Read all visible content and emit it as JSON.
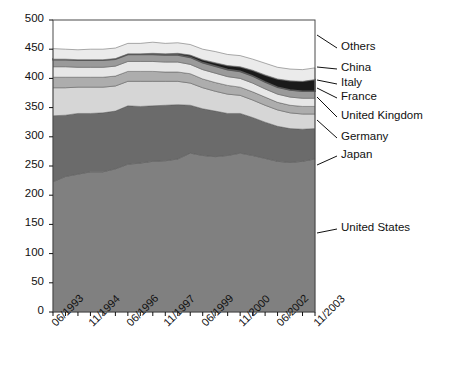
{
  "chart_data": {
    "type": "area",
    "stacked": true,
    "title": "",
    "xlabel": "",
    "ylabel": "",
    "ylim": [
      0,
      500
    ],
    "yticks": [
      0,
      50,
      100,
      150,
      200,
      250,
      300,
      350,
      400,
      450,
      500
    ],
    "grid": false,
    "legend_position": "right-outside",
    "x": [
      "06/1993",
      "11/1993",
      "06/1994",
      "11/1994",
      "06/1995",
      "11/1995",
      "06/1996",
      "11/1996",
      "06/1997",
      "11/1997",
      "06/1998",
      "11/1998",
      "06/1999",
      "11/1999",
      "06/2000",
      "11/2000",
      "06/2001",
      "11/2001",
      "06/2002",
      "11/2002",
      "06/2003",
      "11/2003"
    ],
    "xtick_labels": [
      "06/1993",
      "11/1994",
      "06/1996",
      "11/1997",
      "06/1999",
      "11/2000",
      "06/2002",
      "11/2003"
    ],
    "xtick_index": [
      0,
      3,
      6,
      9,
      12,
      15,
      18,
      21
    ],
    "series": [
      {
        "name": "United States",
        "color": "#808080",
        "values": [
          223,
          232,
          236,
          240,
          240,
          245,
          253,
          255,
          258,
          259,
          262,
          272,
          268,
          266,
          268,
          272,
          268,
          263,
          258,
          256,
          258,
          262
        ]
      },
      {
        "name": "Japan",
        "color": "#6b6b6b",
        "values": [
          113,
          105,
          104,
          100,
          101,
          99,
          100,
          97,
          95,
          95,
          93,
          82,
          80,
          78,
          72,
          68,
          65,
          62,
          60,
          58,
          55,
          52
        ]
      },
      {
        "name": "Germany",
        "color": "#d6d6d6",
        "values": [
          48,
          47,
          45,
          45,
          44,
          43,
          42,
          43,
          42,
          41,
          40,
          38,
          36,
          34,
          33,
          31,
          30,
          29,
          28,
          27,
          26,
          25
        ]
      },
      {
        "name": "United Kingdom",
        "color": "#adadad",
        "values": [
          18,
          18,
          17,
          17,
          17,
          17,
          17,
          17,
          17,
          16,
          16,
          16,
          15,
          15,
          15,
          14,
          14,
          14,
          13,
          13,
          13,
          13
        ]
      },
      {
        "name": "France",
        "color": "#e7e7e7",
        "values": [
          18,
          18,
          17,
          17,
          17,
          17,
          17,
          17,
          17,
          17,
          17,
          16,
          16,
          16,
          15,
          15,
          15,
          14,
          14,
          14,
          14,
          14
        ]
      },
      {
        "name": "Italy",
        "color": "#9a9a9a",
        "values": [
          12,
          12,
          12,
          12,
          12,
          12,
          12,
          12,
          12,
          12,
          12,
          12,
          12,
          12,
          12,
          12,
          12,
          12,
          12,
          12,
          12,
          12
        ]
      },
      {
        "name": "China",
        "color": "#1a1a1a",
        "values": [
          1,
          1,
          1,
          1,
          1,
          1,
          1,
          1,
          2,
          2,
          3,
          4,
          5,
          6,
          7,
          8,
          10,
          12,
          14,
          16,
          17,
          20
        ]
      },
      {
        "name": "Others",
        "color": "#ebebeb",
        "values": [
          18,
          17,
          17,
          18,
          18,
          18,
          18,
          18,
          19,
          18,
          18,
          18,
          18,
          19,
          19,
          19,
          19,
          20,
          20,
          20,
          20,
          20
        ]
      }
    ],
    "legend_labels": [
      "Others",
      "China",
      "Italy",
      "France",
      "United Kingdom",
      "Germany",
      "Japan",
      "United States"
    ]
  }
}
